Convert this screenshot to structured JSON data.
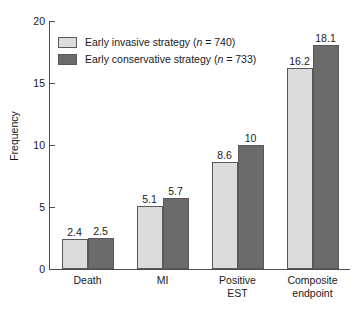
{
  "chart_data": {
    "type": "bar",
    "title": "",
    "xlabel": "",
    "ylabel": "Frequency",
    "ylim": [
      0,
      20
    ],
    "yticks": [
      0,
      5,
      10,
      15,
      20
    ],
    "ytick_labels": [
      "0",
      "5",
      "10",
      "15",
      "20"
    ],
    "grid": false,
    "legend_position": "upper left",
    "categories": [
      "Death",
      "MI",
      "Positive EST",
      "Composite endpoint"
    ],
    "category_lines": [
      [
        "Death"
      ],
      [
        "MI"
      ],
      [
        "Positive",
        "EST"
      ],
      [
        "Composite",
        "endpoint"
      ]
    ],
    "series": [
      {
        "name": "Early invasive strategy (n = 740)",
        "color": "#dcdcdc",
        "n": 740,
        "values": [
          2.4,
          5.1,
          8.6,
          16.2
        ],
        "value_labels": [
          "2.4",
          "5.1",
          "8.6",
          "16.2"
        ]
      },
      {
        "name": "Early conservative strategy (n = 733)",
        "color": "#6b6b6b",
        "n": 733,
        "values": [
          2.5,
          5.7,
          10,
          18.1
        ],
        "value_labels": [
          "2.5",
          "5.7",
          "10",
          "18.1"
        ]
      }
    ]
  },
  "legend": {
    "items": [
      {
        "label_pre": "Early invasive strategy (",
        "label_n": "n",
        "label_post": " = 740)"
      },
      {
        "label_pre": "Early conservative strategy (",
        "label_n": "n",
        "label_post": " = 733)"
      }
    ]
  },
  "axes": {
    "y_title": "Frequency"
  }
}
